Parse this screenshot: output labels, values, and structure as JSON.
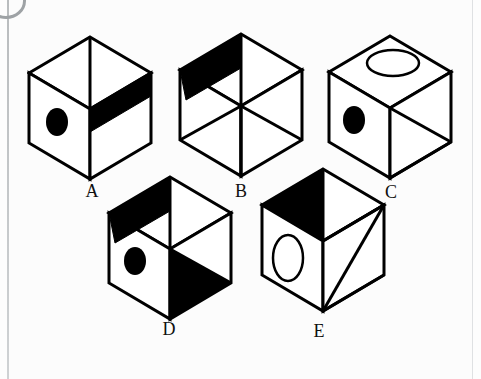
{
  "page": {
    "background_color": "#fcfcfc",
    "ink_color": "#000000",
    "edge_rule_color": "#b9bcbe"
  },
  "figures": [
    {
      "id": "cube-a",
      "label": "A",
      "label_x": 79,
      "label_y": 182,
      "origin_x": 27,
      "origin_y": 33,
      "width": 128,
      "height": 150,
      "top_face": {
        "fill": "white",
        "marking": "none",
        "center_seam": true
      },
      "left_face": {
        "fill": "white",
        "marking": "filled-ellipse"
      },
      "right_face": {
        "fill": "white",
        "marking": "black-horizontal-band"
      }
    },
    {
      "id": "cube-b",
      "label": "B",
      "label_x": 228,
      "label_y": 182,
      "origin_x": 176,
      "origin_y": 28,
      "width": 130,
      "height": 152,
      "top_face": {
        "fill": "white",
        "marking": "black-band-left-half",
        "center_seam": true
      },
      "left_face": {
        "fill": "white",
        "marking": "diagonal-from-center"
      },
      "right_face": {
        "fill": "white",
        "marking": "diagonal-from-center"
      }
    },
    {
      "id": "cube-c",
      "label": "C",
      "label_x": 378,
      "label_y": 183,
      "origin_x": 325,
      "origin_y": 30,
      "width": 130,
      "height": 152,
      "top_face": {
        "fill": "white",
        "marking": "outline-ellipse"
      },
      "left_face": {
        "fill": "white",
        "marking": "filled-ellipse"
      },
      "right_face": {
        "fill": "white",
        "marking": "double-diagonal-wedge"
      }
    },
    {
      "id": "cube-d",
      "label": "D",
      "label_x": 156,
      "label_y": 320,
      "origin_x": 105,
      "origin_y": 172,
      "width": 130,
      "height": 150,
      "top_face": {
        "fill": "white",
        "marking": "black-band-left-half",
        "center_seam": true
      },
      "left_face": {
        "fill": "white",
        "marking": "filled-ellipse"
      },
      "right_face": {
        "fill": "white",
        "marking": "black-lower-triangle"
      }
    },
    {
      "id": "cube-e",
      "label": "E",
      "label_x": 306,
      "label_y": 322,
      "origin_x": 253,
      "origin_y": 163,
      "width": 140,
      "height": 158,
      "top_face": {
        "fill": "white",
        "marking": "black-left-triangle"
      },
      "left_face": {
        "fill": "white",
        "marking": "outline-ellipse"
      },
      "right_face": {
        "fill": "white",
        "marking": "corner-diagonals"
      }
    }
  ],
  "labels": {
    "a": "A",
    "b": "B",
    "c": "C",
    "d": "D",
    "e": "E"
  }
}
